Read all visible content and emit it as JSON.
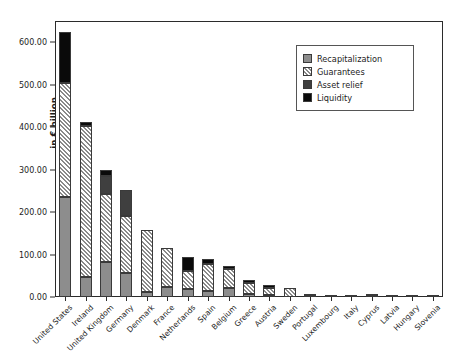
{
  "chart_data": {
    "type": "bar",
    "subtype": "stacked-vertical",
    "title": "",
    "subtitle": "",
    "xlabel": "",
    "ylabel": "in € billion",
    "ylim": [
      0,
      650
    ],
    "ytick_labels": [
      "0.00",
      "100.00",
      "200.00",
      "300.00",
      "400.00",
      "500.00",
      "600.00"
    ],
    "ytick_values": [
      0,
      100,
      200,
      300,
      400,
      500,
      600
    ],
    "grid": false,
    "legend_position": "top-right",
    "categories": [
      "United States",
      "Ireland",
      "United Kingdom",
      "Germany",
      "Denmark",
      "France",
      "Netherlands",
      "Spain",
      "Belgium",
      "Greece",
      "Austria",
      "Sweden",
      "Portugal",
      "Luxembourg",
      "Italy",
      "Cyprus",
      "Latvia",
      "Hungary",
      "Slovenia"
    ],
    "series": [
      {
        "name": "Recapitalization",
        "color": "#8d8d8d",
        "pattern": "solid-gray",
        "values": [
          235,
          47,
          82,
          56,
          12,
          24,
          19,
          13,
          21,
          7,
          4,
          0,
          2,
          0,
          4,
          2,
          1,
          1,
          1
        ]
      },
      {
        "name": "Guarantees",
        "color": "#ffffff",
        "pattern": "diagonal-hatch",
        "values": [
          270,
          356,
          160,
          134,
          146,
          91,
          42,
          64,
          46,
          26,
          18,
          21,
          4,
          5,
          0,
          1,
          1,
          1,
          1
        ]
      },
      {
        "name": "Asset relief",
        "color": "#3f3f3f",
        "pattern": "solid-dark-gray",
        "values": [
          0,
          0,
          43,
          61,
          0,
          0,
          0,
          0,
          0,
          0,
          0,
          0,
          0,
          0,
          0,
          0,
          0,
          0,
          0
        ]
      },
      {
        "name": "Liquidity",
        "color": "#0a0a0a",
        "pattern": "solid-black",
        "values": [
          120,
          9,
          15,
          0,
          0,
          0,
          34,
          13,
          6,
          7,
          6,
          0,
          0,
          0,
          0,
          0,
          0,
          0,
          0
        ]
      }
    ],
    "totals": [
      625,
      412,
      300,
      251,
      158,
      115,
      95,
      90,
      73,
      40,
      28,
      21,
      6,
      5,
      4,
      3,
      2,
      2,
      2
    ]
  },
  "legend": {
    "entries": [
      {
        "label": "Recapitalization",
        "swatch": "swatch-recapitalization"
      },
      {
        "label": "Guarantees",
        "swatch": "swatch-guarantees"
      },
      {
        "label": "Asset relief",
        "swatch": "swatch-asset-relief"
      },
      {
        "label": "Liquidity",
        "swatch": "swatch-liquidity"
      }
    ]
  }
}
